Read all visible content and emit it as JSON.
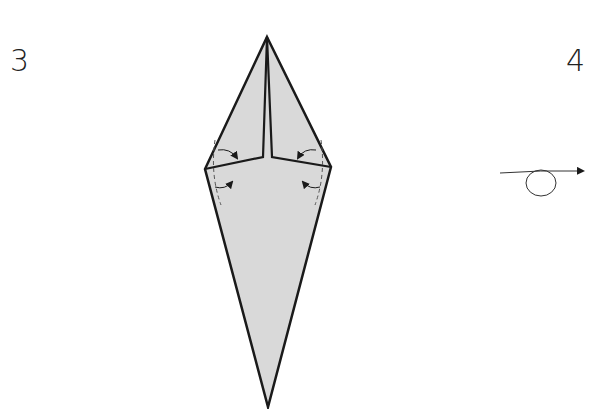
{
  "steps": [
    {
      "number": "3",
      "description": "squash-fold side flaps inward (four small curved fold arrows)"
    },
    {
      "number": "4",
      "description": "turn model over"
    }
  ],
  "colors": {
    "paper_fill": "#d9d9d9",
    "outline": "#1a1a1a",
    "background": "#ffffff"
  },
  "icons": {
    "turn_over": "turn-over-loop-arrow-icon",
    "fold_arrows": "curved-fold-arrow-icon"
  }
}
